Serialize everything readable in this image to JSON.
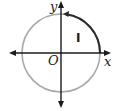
{
  "diagram": {
    "type": "unit-circle",
    "axes": {
      "x_label": "x",
      "y_label": "y",
      "origin_label": "O"
    },
    "quadrant_label": "I",
    "highlighted_arc": {
      "from": "positive x-axis",
      "to": "positive y-axis",
      "direction": "counterclockwise",
      "color": "#2b2b2b"
    },
    "colors": {
      "circle": "#a8a8a8",
      "axes": "#1a1a1a",
      "arc": "#2b2b2b"
    }
  }
}
